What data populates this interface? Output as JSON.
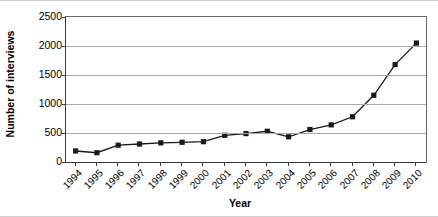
{
  "chart_data": {
    "type": "line",
    "title": "",
    "xlabel": "Year",
    "ylabel": "Number of interviews",
    "categories": [
      "1994",
      "1995",
      "1996",
      "1997",
      "1998",
      "1999",
      "2000",
      "2001",
      "2002",
      "2003",
      "2004",
      "2005",
      "2006",
      "2007",
      "2008",
      "2009",
      "2010"
    ],
    "values": [
      190,
      160,
      290,
      310,
      330,
      340,
      350,
      460,
      490,
      530,
      435,
      560,
      640,
      780,
      1150,
      1680,
      2050
    ],
    "ylim": [
      0,
      2500
    ],
    "yticks": [
      "0",
      "500",
      "1000",
      "1500",
      "2000",
      "2500"
    ],
    "ytick_values": [
      0,
      500,
      1000,
      1500,
      2000,
      2500
    ],
    "grid": "horizontal",
    "legend": "none",
    "marker": "square",
    "series_color": "#1a1a1a",
    "grid_color": "#a9a9a9",
    "axis_color": "#3a3a3a"
  }
}
